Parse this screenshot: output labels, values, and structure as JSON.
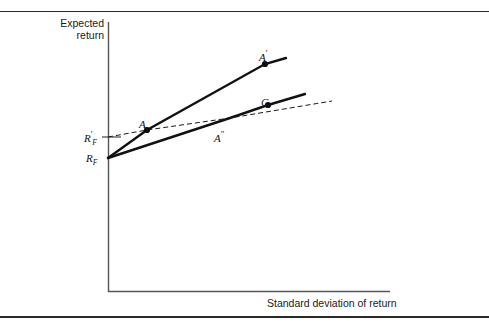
{
  "chart_data": {
    "type": "line",
    "title": "",
    "xlabel": "Standard deviation of return",
    "ylabel": "Expected return",
    "grid": false,
    "legend": null,
    "axis": {
      "x_axis_label": "Standard deviation of return",
      "y_axis_label_line1": "Expected",
      "y_axis_label_line2": "return",
      "y_tick_labels": [
        "R'",
        "R"
      ],
      "y_tick_subscripts": [
        "F",
        "F"
      ],
      "y_tick_label_rf_prime": "R'_F",
      "y_tick_label_rf": "R_F",
      "x_range_note": "unitless",
      "y_range_note": "unitless"
    },
    "series": [
      {
        "name": "capital-market-line-A-prime",
        "style": "solid",
        "width": 2.4,
        "comment": "Steep borrowing/lending line from R_F through A to A'",
        "points": [
          [
            108,
            158
          ],
          [
            147,
            130
          ],
          [
            265,
            64
          ],
          [
            286,
            58
          ]
        ]
      },
      {
        "name": "capital-market-line-C",
        "style": "solid",
        "width": 2.4,
        "comment": "Flatter line from R_F through A'' to C and beyond",
        "points": [
          [
            108,
            158
          ],
          [
            230,
            118
          ],
          [
            268,
            105
          ],
          [
            305,
            94
          ]
        ]
      },
      {
        "name": "borrowing-line-dashed",
        "style": "dashed",
        "width": 1,
        "comment": "Dashed line from R'_F level through A and A'' extending right",
        "points": [
          [
            108,
            137
          ],
          [
            147,
            130
          ],
          [
            230,
            118
          ],
          [
            332,
            101
          ]
        ]
      }
    ],
    "points": [
      {
        "id": "A",
        "label": "A",
        "prime": "",
        "x": 147,
        "y": 130,
        "label_dx": -8,
        "label_dy": -12
      },
      {
        "id": "Ap",
        "label": "A",
        "prime": "'",
        "x": 265,
        "y": 64,
        "label_dx": -6,
        "label_dy": -16
      },
      {
        "id": "C",
        "label": "C",
        "prime": "",
        "x": 268,
        "y": 105,
        "label_dx": -7,
        "label_dy": -9
      },
      {
        "id": "App",
        "label": "A",
        "prime": "\"",
        "x": 230,
        "y": 118,
        "label_dx": -16,
        "label_dy": 11
      }
    ],
    "tick_marks": [
      {
        "id": "rf-prime",
        "axis": "y",
        "value_label": "R'_F",
        "y": 137
      },
      {
        "id": "rf",
        "axis": "y",
        "value_label": "R_F",
        "y": 158
      }
    ]
  },
  "labels": {
    "y_axis_caption": "Expected\nreturn",
    "x_axis_caption": "Standard deviation of return",
    "rf_prime_base": "R",
    "rf_prime_mark": "'",
    "rf_prime_sub": "F",
    "rf_base": "R",
    "rf_sub": "F",
    "point_A": "A",
    "point_A_prime_base": "A",
    "point_A_prime_mark": "'",
    "point_C": "C",
    "point_A_double_prime_base": "A",
    "point_A_double_prime_mark": "\""
  },
  "colors": {
    "background": "#ffffff",
    "ink": "#1a1a1a",
    "axis": "#555555",
    "line": "#111111",
    "rule": "#2a2a2a"
  }
}
